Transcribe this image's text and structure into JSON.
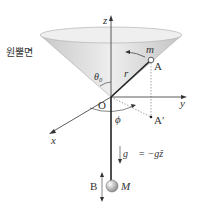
{
  "diagram": {
    "surface_label": "원뿔면",
    "labels": {
      "z_axis": "z",
      "y_axis": "y",
      "x_axis": "x",
      "origin": "O",
      "point_a": "A",
      "point_a_prime": "A′",
      "point_b": "B",
      "mass_small": "m",
      "mass_large": "M",
      "radius": "r",
      "cone_angle": "θ₀",
      "azimuth": "ϕ",
      "gravity": "g⃗ = −gẑ"
    },
    "colors": {
      "cone_fill": "#d9d9d9",
      "cone_rim": "#eeeeee",
      "line": "#333333",
      "rod": "#222222",
      "ball": "#bbbbbb"
    }
  }
}
